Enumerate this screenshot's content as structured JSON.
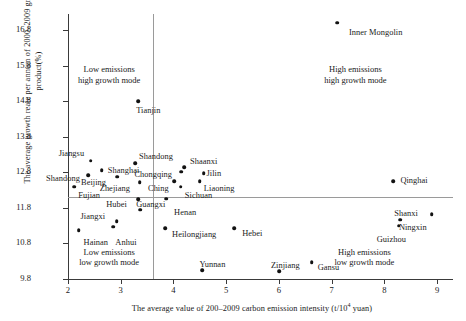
{
  "chart_data": {
    "type": "scatter",
    "title": "",
    "xlabel": "The average value of 200–2009 carbon emission intensity (t/10⁴ yuan)",
    "ylabel": "The average growth reate per annum of 2000–2009 gross rgeional product(%)",
    "xlim": [
      2,
      9.3
    ],
    "ylim": [
      9.8,
      17.25
    ],
    "xticks": [
      "2",
      "3",
      "4",
      "5",
      "6",
      "7",
      "8",
      "9"
    ],
    "xtick_values": [
      2,
      3,
      4,
      5,
      6,
      7,
      8,
      9
    ],
    "yticks": [
      "9.8",
      "10.8",
      "11.8",
      "12.8",
      "13.8",
      "14.8",
      "15.8",
      "16.8"
    ],
    "ytick_values": [
      9.8,
      10.8,
      11.8,
      12.8,
      13.8,
      14.8,
      15.8,
      16.8
    ],
    "grid": false,
    "legend": "none",
    "reference_lines": {
      "vertical_x": 3.62,
      "horizontal_y": 12.1
    },
    "points": [
      {
        "label": "Inner Mongolin",
        "x": 7.1,
        "y": 17.0,
        "lx": 12,
        "ly": 5
      },
      {
        "label": "Tianjin",
        "x": 3.33,
        "y": 14.8,
        "lx": -2,
        "ly": 5
      },
      {
        "label": "Jiangsu",
        "x": 2.43,
        "y": 13.13,
        "lx": -32,
        "ly": -12
      },
      {
        "label": "Shandong",
        "x": 3.27,
        "y": 13.06,
        "lx": 4,
        "ly": -11
      },
      {
        "label": "Shanghai",
        "x": 2.64,
        "y": 12.86,
        "lx": 6,
        "ly": -4
      },
      {
        "label": "Shandong",
        "x": 2.38,
        "y": 12.72,
        "lx": -42,
        "ly": -1
      },
      {
        "label": "Beijing",
        "x": 2.93,
        "y": 12.68,
        "lx": -36,
        "ly": 1
      },
      {
        "label": "Zhejiang",
        "x": 3.36,
        "y": 12.52,
        "lx": -40,
        "ly": 2
      },
      {
        "label": "Fujian",
        "x": 2.12,
        "y": 12.4,
        "lx": 4,
        "ly": 4
      },
      {
        "label": "Chongqing",
        "x": 4.15,
        "y": 12.82,
        "lx": -47,
        "ly": -2
      },
      {
        "label": "Shaanxi",
        "x": 4.2,
        "y": 12.95,
        "lx": 6,
        "ly": -10
      },
      {
        "label": "Jilin",
        "x": 4.57,
        "y": 12.78,
        "lx": 3,
        "ly": -4
      },
      {
        "label": "Liaoning",
        "x": 4.5,
        "y": 12.55,
        "lx": 4,
        "ly": 3
      },
      {
        "label": "Ching",
        "x": 4.01,
        "y": 12.55,
        "lx": -26,
        "ly": 3
      },
      {
        "label": "Sichuan",
        "x": 4.14,
        "y": 12.4,
        "lx": 4,
        "ly": 4
      },
      {
        "label": "Qinghai",
        "x": 8.17,
        "y": 12.55,
        "lx": 7,
        "ly": -5
      },
      {
        "label": "Hubei",
        "x": 3.33,
        "y": 12.04,
        "lx": -32,
        "ly": 1
      },
      {
        "label": "Henan",
        "x": 3.86,
        "y": 12.06,
        "lx": 8,
        "ly": 9
      },
      {
        "label": "Guangxi",
        "x": 3.37,
        "y": 11.75,
        "lx": -4,
        "ly": -10
      },
      {
        "label": "Jiangxi",
        "x": 2.92,
        "y": 11.43,
        "lx": -36,
        "ly": -9
      },
      {
        "label": "Shanxi",
        "x": 8.3,
        "y": 11.47,
        "lx": -6,
        "ly": -11
      },
      {
        "label": "Ningxin",
        "x": 8.9,
        "y": 11.62,
        "lx": -33,
        "ly": 9
      },
      {
        "label": "Guizhou",
        "x": 8.27,
        "y": 11.3,
        "lx": -22,
        "ly": 9
      },
      {
        "label": "Hainan",
        "x": 2.2,
        "y": 11.17,
        "lx": 5,
        "ly": 8
      },
      {
        "label": "Anhui",
        "x": 2.86,
        "y": 11.27,
        "lx": 2,
        "ly": 11
      },
      {
        "label": "Heilongjiang",
        "x": 3.84,
        "y": 11.23,
        "lx": 7,
        "ly": 2
      },
      {
        "label": "Hebei",
        "x": 5.15,
        "y": 11.22,
        "lx": 8,
        "ly": 1
      },
      {
        "label": "Yunnan",
        "x": 4.55,
        "y": 10.05,
        "lx": -3,
        "ly": -10
      },
      {
        "label": "Zinjiang",
        "x": 6.0,
        "y": 10.02,
        "lx": -8,
        "ly": -10
      },
      {
        "label": "Gansu",
        "x": 6.62,
        "y": 10.27,
        "lx": 6,
        "ly": 1
      }
    ],
    "annotations": [
      {
        "name": "low-emissions-high-growth",
        "lines": [
          "Low emissions",
          "high growth mode"
        ],
        "x": 2.78,
        "y": 15.55
      },
      {
        "name": "high-emissions-high-growth",
        "lines": [
          "High emissions",
          "high growth mode"
        ],
        "x": 7.45,
        "y": 15.55
      },
      {
        "name": "low-emissions-low-growth",
        "lines": [
          "Low emissions",
          "low growth mode"
        ],
        "x": 2.78,
        "y": 10.42
      },
      {
        "name": "high-emissions-low-growth",
        "lines": [
          "High emissions",
          "low growth mode"
        ],
        "x": 7.62,
        "y": 10.42
      }
    ]
  }
}
